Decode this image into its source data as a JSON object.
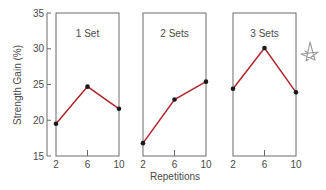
{
  "chart_data": {
    "type": "line",
    "layout": "small-multiples",
    "ylabel": "Strength Gain (%)",
    "xlabel": "Repetitions",
    "ylim": [
      15,
      35
    ],
    "yticks": [
      15,
      20,
      25,
      30,
      35
    ],
    "x": [
      2,
      6,
      10
    ],
    "xticks": [
      "2",
      "6",
      "10"
    ],
    "grid": false,
    "line_color": "#b0262c",
    "marker_color": "#1a1a1a",
    "panels": [
      {
        "title": "1 Set",
        "values": [
          19.5,
          24.7,
          21.6
        ]
      },
      {
        "title": "2 Sets",
        "values": [
          16.8,
          22.9,
          25.4
        ]
      },
      {
        "title": "3 Sets",
        "values": [
          24.4,
          30.1,
          23.9
        ]
      }
    ],
    "annotations": [
      {
        "type": "hand-drawn-star",
        "position": "right of 3 Sets panel"
      }
    ]
  }
}
